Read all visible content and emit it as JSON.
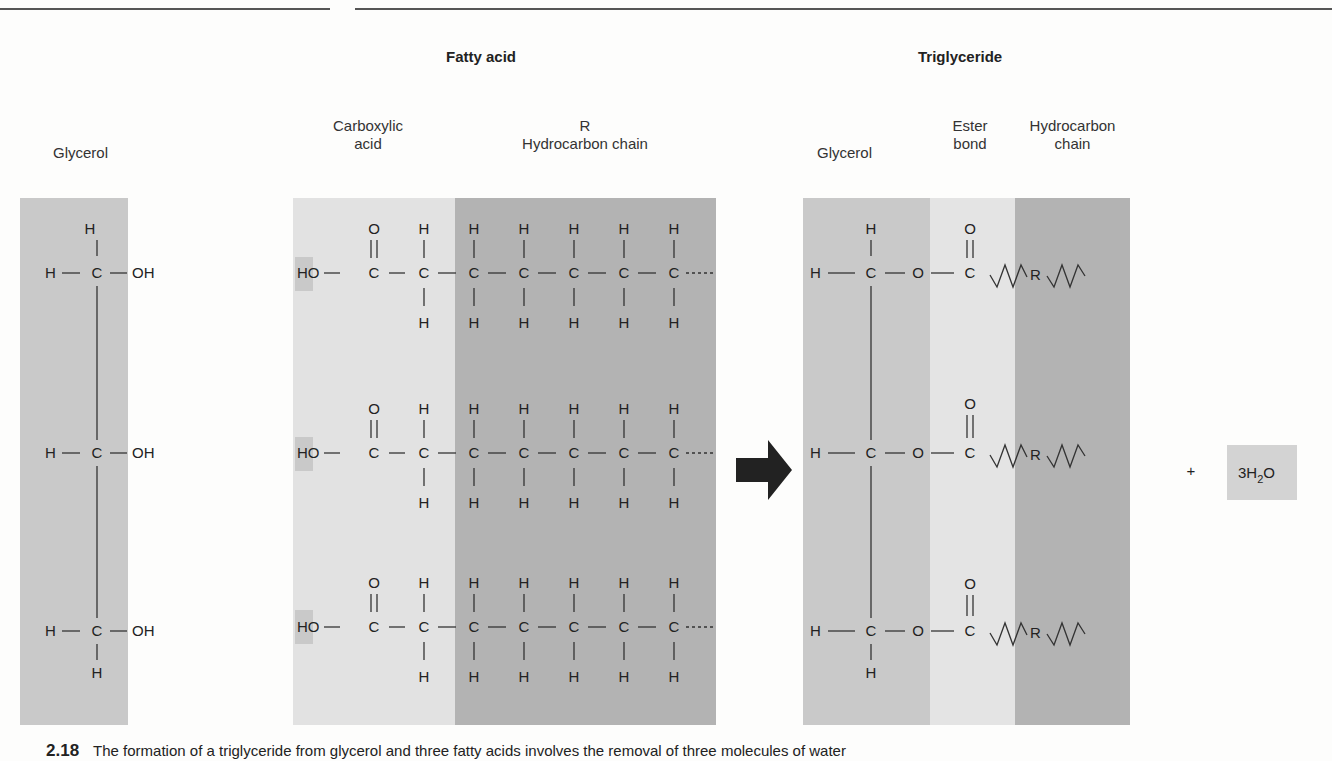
{
  "titles": {
    "fatty_acid": "Fatty acid",
    "triglyceride": "Triglyceride"
  },
  "labels": {
    "glycerol_left": "Glycerol",
    "carboxylic_line1": "Carboxylic",
    "carboxylic_line2": "acid",
    "r_label": "R",
    "hydrocarbon_chain": "Hydrocarbon chain",
    "glycerol_right": "Glycerol",
    "ester_line1": "Ester",
    "ester_line2": "bond",
    "hc_line1": "Hydrocarbon",
    "hc_line2": "chain"
  },
  "atoms": {
    "H": "H",
    "C": "C",
    "O": "O",
    "OH": "OH",
    "HO": "HO",
    "R": "R"
  },
  "reaction": {
    "plus": "+",
    "water_coef": "3H",
    "water_sub": "2",
    "water_tail": "O"
  },
  "caption": {
    "number": "2.18",
    "text": "The formation of a triglyceride from glycerol and three fatty acids involves the removal of three molecules of water"
  },
  "colors": {
    "glycerol_shade": "#c9c9c9",
    "carboxyl_shade": "#e2e2e2",
    "chain_shade": "#b3b3b3",
    "ester_shade": "#e4e4e4",
    "arrow": "#222222"
  }
}
